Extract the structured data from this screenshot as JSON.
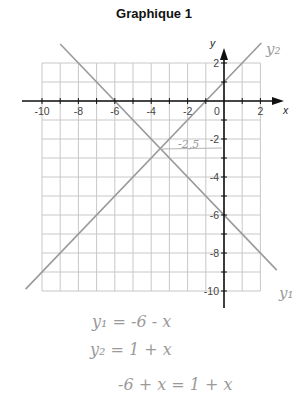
{
  "title": "Graphique 1",
  "axes": {
    "x_label": "x",
    "y_label": "y",
    "x_ticks": [
      {
        "value": -10,
        "label": "-10"
      },
      {
        "value": -8,
        "label": "-8"
      },
      {
        "value": -6,
        "label": "-6"
      },
      {
        "value": -4,
        "label": "-4"
      },
      {
        "value": -2,
        "label": "-2"
      },
      {
        "value": 0,
        "label": "0"
      },
      {
        "value": 2,
        "label": "2"
      }
    ],
    "y_ticks": [
      {
        "value": 2,
        "label": "2"
      },
      {
        "value": -2,
        "label": "-2"
      },
      {
        "value": -4,
        "label": "-4"
      },
      {
        "value": -6,
        "label": "-6"
      },
      {
        "value": -8,
        "label": "-8"
      },
      {
        "value": -10,
        "label": "-10"
      }
    ]
  },
  "lines": [
    {
      "name": "y1",
      "equation": "y = -6 - x",
      "label": "y₁"
    },
    {
      "name": "y2",
      "equation": "y = 1 + x",
      "label": "y₂"
    }
  ],
  "annotations": {
    "intersection_y": "-2,5",
    "line_label_y1": "y₁",
    "line_label_y2": "y₂"
  },
  "handwritten_equations": [
    "y₁ = -6 - x",
    "y₂ = 1 + x",
    "-6 + x = 1 + x"
  ],
  "colors": {
    "grid": "#c8c8c8",
    "axis": "#111111",
    "plot_line": "#9a9a9a",
    "handwriting": "#9a9a9a"
  }
}
